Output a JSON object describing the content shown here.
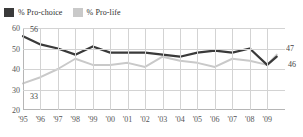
{
  "legend": {
    "position": "top-left",
    "items": [
      {
        "label": "% Pro-choice",
        "color": "#3a3a3a",
        "icon": "legend-swatch-dark"
      },
      {
        "label": "% Pro-life",
        "color": "#c9c9c9",
        "icon": "legend-swatch-light"
      }
    ]
  },
  "chart_data": {
    "type": "line",
    "title": "",
    "subtitle": "",
    "xlabel": "",
    "ylabel": "",
    "grid": true,
    "xlim": [
      1995,
      2010
    ],
    "ylim": [
      20,
      60
    ],
    "yticks": [
      20,
      30,
      40,
      50,
      60
    ],
    "ytick_labels": [
      "20",
      "30",
      "40",
      "50",
      "60"
    ],
    "x": [
      1995,
      1996,
      1997,
      1998,
      1999,
      2000,
      2001,
      2002,
      2003,
      2004,
      2005,
      2006,
      2007,
      2008,
      2009
    ],
    "xtick_labels": [
      "'95",
      "'96",
      "'97",
      "'98",
      "'99",
      "'00",
      "'01",
      "'02",
      "'03",
      "'04",
      "'05",
      "'06",
      "'07",
      "'08",
      "'09"
    ],
    "series": [
      {
        "name": "% Pro-choice",
        "color": "#3a3a3a",
        "values": [
          56,
          52,
          50,
          47,
          51,
          48,
          48,
          48,
          47,
          46,
          48,
          49,
          48,
          50,
          42
        ],
        "end_value": 46
      },
      {
        "name": "% Pro-life",
        "color": "#c9c9c9",
        "values": [
          33,
          36,
          40,
          45,
          42,
          42,
          43,
          41,
          46,
          44,
          43,
          41,
          45,
          44,
          42
        ],
        "end_value": 47
      }
    ],
    "annotations": [
      {
        "text": "56",
        "series": "% Pro-choice",
        "position": "start-top"
      },
      {
        "text": "33",
        "series": "% Pro-life",
        "position": "start-bottom"
      },
      {
        "text": "47",
        "series": "% Pro-life",
        "position": "end-top"
      },
      {
        "text": "46",
        "series": "% Pro-choice",
        "position": "end-bottom"
      }
    ]
  }
}
